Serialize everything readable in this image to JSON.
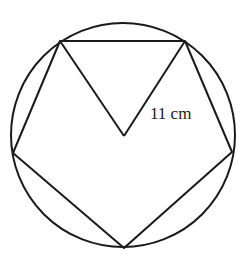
{
  "figure": {
    "type": "regular pentagon inscribed in circle",
    "stroke_color": "#1a1a1a",
    "background": "#ffffff",
    "circle": {
      "cx": 123,
      "cy": 135,
      "r": 112
    },
    "center": {
      "x": 124,
      "y": 136
    },
    "vertices": [
      {
        "x": 60,
        "y": 41
      },
      {
        "x": 185,
        "y": 41
      },
      {
        "x": 232,
        "y": 152
      },
      {
        "x": 124,
        "y": 248
      },
      {
        "x": 13,
        "y": 153
      }
    ],
    "radius_label": "11 cm"
  }
}
